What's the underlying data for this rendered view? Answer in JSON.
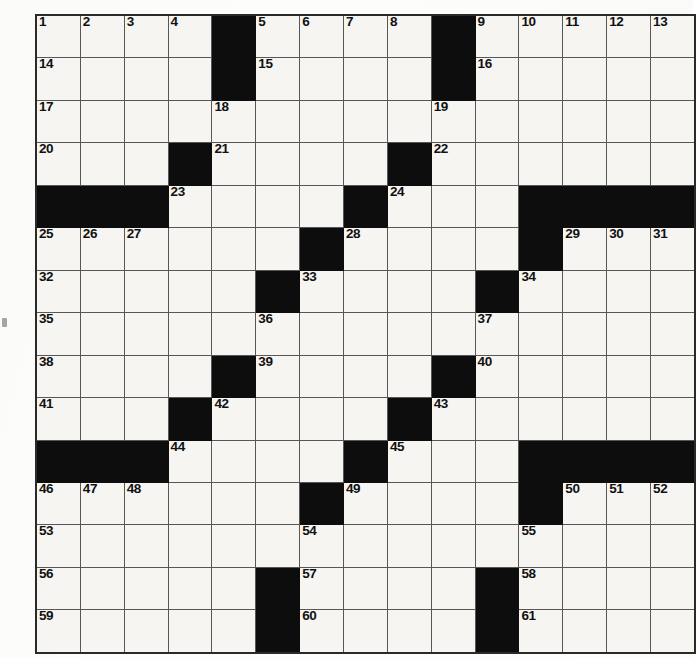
{
  "puzzle": {
    "title": "Crossword Puzzle Grid",
    "type": "crossword-grid",
    "rows": 15,
    "cols": 15,
    "colors": {
      "cell_fill": "#f6f5f2",
      "block_fill": "#0d0d0d",
      "grid_line": "#575757",
      "outer_border": "#2a2a2a",
      "number_color": "#111111",
      "page_background": "#fdfdfb"
    },
    "layout": {
      "cell_width_px": 42.87,
      "cell_height_px": 41.47,
      "origin_x_px": 35,
      "origin_y_px": 14
    },
    "max_number": 61,
    "block_count": 60,
    "grid": [
      [
        "1",
        "2",
        "3",
        "4",
        "#",
        "5",
        "6",
        "7",
        "8",
        "#",
        "9",
        "10",
        "11",
        "12",
        "13"
      ],
      [
        "14",
        "",
        "",
        "",
        "#",
        "15",
        "",
        "",
        "",
        "#",
        "16",
        "",
        "",
        "",
        ""
      ],
      [
        "17",
        "",
        "",
        "",
        "18",
        "",
        "",
        "",
        "",
        "19",
        "",
        "",
        "",
        "",
        ""
      ],
      [
        "20",
        "",
        "",
        "#",
        "21",
        "",
        "",
        "",
        "#",
        "22",
        "",
        "",
        "",
        "",
        ""
      ],
      [
        "#",
        "#",
        "#",
        "23",
        "",
        "",
        "",
        "#",
        "24",
        "",
        "",
        "#",
        "#",
        "#",
        "#"
      ],
      [
        "25",
        "26",
        "27",
        "",
        "",
        "",
        "#",
        "28",
        "",
        "",
        "",
        "#",
        "29",
        "30",
        "31"
      ],
      [
        "32",
        "",
        "",
        "",
        "",
        "#",
        "33",
        "",
        "",
        "",
        "#",
        "34",
        "",
        "",
        ""
      ],
      [
        "35",
        "",
        "",
        "",
        "",
        "36",
        "",
        "",
        "",
        "",
        "37",
        "",
        "",
        "",
        ""
      ],
      [
        "38",
        "",
        "",
        "",
        "#",
        "39",
        "",
        "",
        "",
        "#",
        "40",
        "",
        "",
        "",
        ""
      ],
      [
        "41",
        "",
        "",
        "#",
        "42",
        "",
        "",
        "",
        "#",
        "43",
        "",
        "",
        "",
        "",
        ""
      ],
      [
        "#",
        "#",
        "#",
        "44",
        "",
        "",
        "",
        "#",
        "45",
        "",
        "",
        "#",
        "#",
        "#",
        "#"
      ],
      [
        "46",
        "47",
        "48",
        "",
        "",
        "",
        "#",
        "49",
        "",
        "",
        "",
        "#",
        "50",
        "51",
        "52"
      ],
      [
        "53",
        "",
        "",
        "",
        "",
        "",
        "54",
        "",
        "",
        "",
        "",
        "55",
        "",
        "",
        ""
      ],
      [
        "56",
        "",
        "",
        "",
        "",
        "#",
        "57",
        "",
        "",
        "",
        "#",
        "58",
        "",
        "",
        ""
      ],
      [
        "59",
        "",
        "",
        "",
        "",
        "#",
        "60",
        "",
        "",
        "",
        "#",
        "61",
        "",
        "",
        ""
      ]
    ],
    "across_numbers": [
      1,
      5,
      9,
      14,
      15,
      16,
      17,
      19,
      20,
      21,
      22,
      23,
      24,
      25,
      28,
      29,
      32,
      33,
      34,
      35,
      36,
      37,
      38,
      39,
      40,
      41,
      42,
      43,
      44,
      45,
      46,
      49,
      50,
      53,
      54,
      55,
      56,
      57,
      58,
      59,
      60,
      61
    ],
    "down_numbers": [
      1,
      2,
      3,
      4,
      5,
      6,
      7,
      8,
      9,
      10,
      11,
      12,
      13,
      18,
      21,
      22,
      23,
      24,
      26,
      27,
      28,
      29,
      30,
      31,
      33,
      36,
      39,
      42,
      44,
      45,
      47,
      48,
      49,
      50,
      51,
      52,
      54,
      55,
      57,
      58
    ]
  }
}
